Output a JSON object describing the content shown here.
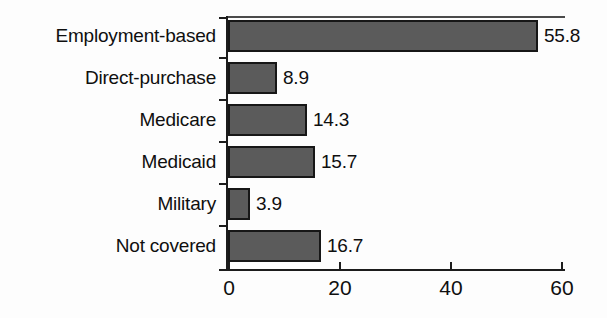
{
  "chart_data": {
    "type": "bar",
    "orientation": "horizontal",
    "title": "",
    "xlabel": "",
    "ylabel": "",
    "categories": [
      "Employment-based",
      "Direct-purchase",
      "Medicare",
      "Medicaid",
      "Military",
      "Not covered"
    ],
    "values": [
      55.8,
      8.9,
      14.3,
      15.7,
      3.9,
      16.7
    ],
    "value_labels": [
      "55.8",
      "8.9",
      "14.3",
      "15.7",
      "3.9",
      "16.7"
    ],
    "xlim": [
      0,
      60
    ],
    "xticks": [
      0,
      20,
      40,
      60
    ],
    "xtick_labels": [
      "0",
      "20",
      "40",
      "60"
    ],
    "grid": false,
    "legend": null,
    "bar_color": "#5b5b5b",
    "bar_edge_color": "#171717",
    "axis_color": "#1c1c1c",
    "background": "#fdfdfd"
  }
}
